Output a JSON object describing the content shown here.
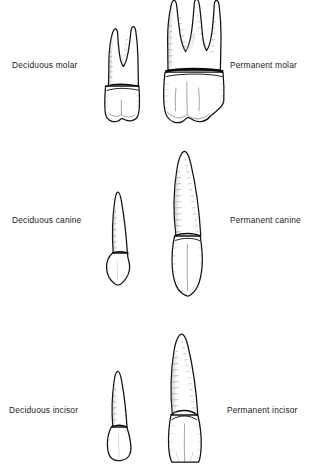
{
  "figure": {
    "background_color": "#ffffff",
    "ink_color": "#121212",
    "style": "pen-and-ink line drawing"
  },
  "rows": [
    {
      "id": "molar",
      "tooth_type": "molar",
      "left": {
        "label": "Deciduous molar",
        "dentition": "deciduous",
        "root_count": 2,
        "relative_size": "smaller"
      },
      "right": {
        "label": "Permanent molar",
        "dentition": "permanent",
        "root_count": 3,
        "relative_size": "larger"
      }
    },
    {
      "id": "canine",
      "tooth_type": "canine",
      "left": {
        "label": "Deciduous canine",
        "dentition": "deciduous",
        "root_count": 1,
        "relative_size": "smaller"
      },
      "right": {
        "label": "Permanent canine",
        "dentition": "permanent",
        "root_count": 1,
        "relative_size": "larger"
      }
    },
    {
      "id": "incisor",
      "tooth_type": "incisor",
      "left": {
        "label": "Deciduous incisor",
        "dentition": "deciduous",
        "root_count": 1,
        "relative_size": "smaller"
      },
      "right": {
        "label": "Permanent incisor",
        "dentition": "permanent",
        "root_count": 1,
        "relative_size": "larger"
      }
    }
  ]
}
